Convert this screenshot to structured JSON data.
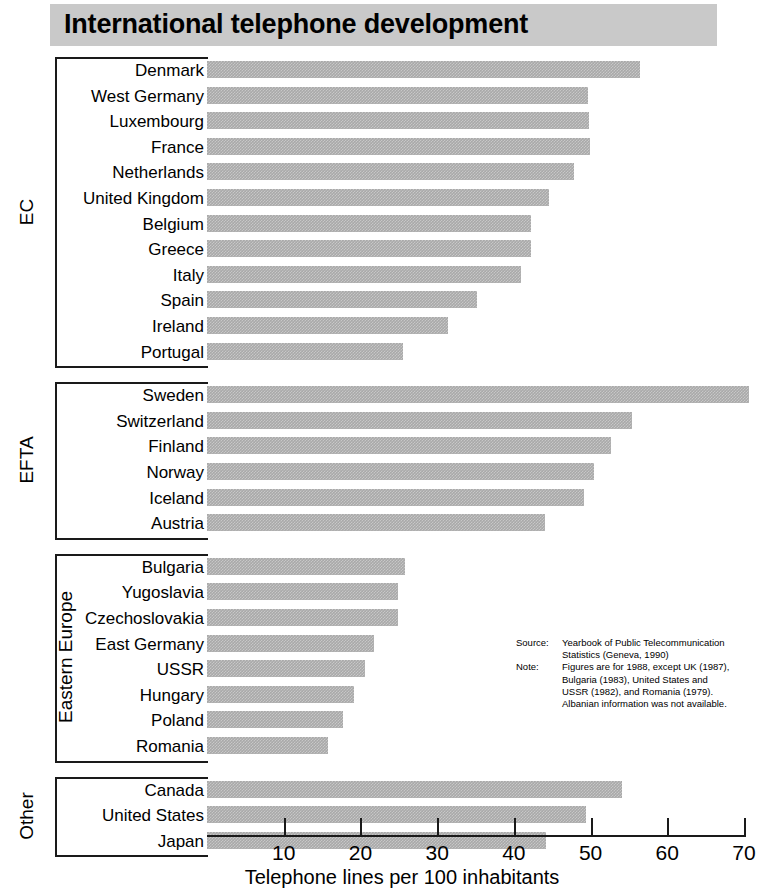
{
  "title": "International telephone development",
  "axis": {
    "title": "Telephone lines per 100 inhabitants",
    "ticks": [
      "10",
      "20",
      "30",
      "40",
      "50",
      "60",
      "70"
    ]
  },
  "source": {
    "source_key": "Source:",
    "source_line1": "Yearbook of Public Telecommunication",
    "source_line2": "Statistics (Geneva, 1990)",
    "note_key": "Note:",
    "note_line1": "Figures are for 1988, except UK (1987),",
    "note_line2": "Bulgaria (1983), United States and",
    "note_line3": "USSR (1982), and Romania (1979).",
    "note_line4": "Albanian information was not available."
  },
  "colors": {
    "bar": "#a9a9a9",
    "title_band": "#c9c9c9",
    "line": "#1a1a1a"
  },
  "chart_data": {
    "type": "bar",
    "orientation": "horizontal",
    "title": "International telephone development",
    "xlabel": "Telephone lines per 100 inhabitants",
    "ylabel": "",
    "xlim": [
      0,
      70
    ],
    "xticks": [
      10,
      20,
      30,
      40,
      50,
      60,
      70
    ],
    "grid": false,
    "legend": false,
    "groups": [
      {
        "name": "EC",
        "categories": [
          "Denmark",
          "West Germany",
          "Luxembourg",
          "France",
          "Netherlands",
          "United Kingdom",
          "Belgium",
          "Greece",
          "Italy",
          "Spain",
          "Ireland",
          "Portugal"
        ],
        "values": [
          56.5,
          49.6,
          49.8,
          49.9,
          47.8,
          44.6,
          42.2,
          42.2,
          40.9,
          35.2,
          31.4,
          25.5
        ]
      },
      {
        "name": "EFTA",
        "categories": [
          "Sweden",
          "Switzerland",
          "Finland",
          "Norway",
          "Iceland",
          "Austria"
        ],
        "values": [
          70.6,
          55.4,
          52.6,
          50.5,
          49.2,
          44.1
        ]
      },
      {
        "name": "Eastern Europe",
        "categories": [
          "Bulgaria",
          "Yugoslavia",
          "Czechoslovakia",
          "East Germany",
          "USSR",
          "Hungary",
          "Poland",
          "Romania"
        ],
        "values": [
          25.8,
          24.9,
          24.9,
          21.8,
          20.6,
          19.1,
          17.7,
          15.8
        ]
      },
      {
        "name": "Other",
        "categories": [
          "Canada",
          "United States",
          "Japan"
        ],
        "values": [
          54.1,
          49.4,
          44.2
        ]
      }
    ]
  }
}
